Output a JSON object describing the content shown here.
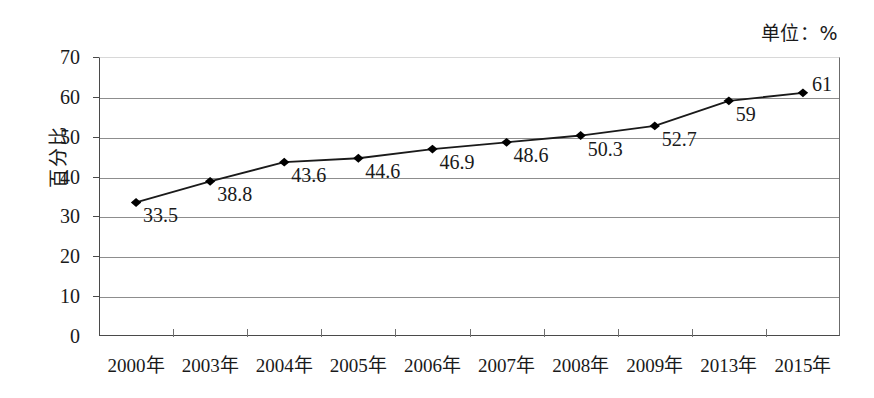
{
  "unit_note": "单位：%",
  "chart_data": {
    "type": "line",
    "title": "",
    "subtitle": "",
    "xlabel": "",
    "ylabel": "百分比",
    "unit_note": "单位：%",
    "categories": [
      "2000年",
      "2003年",
      "2004年",
      "2005年",
      "2006年",
      "2007年",
      "2008年",
      "2009年",
      "2013年",
      "2015年"
    ],
    "values": [
      33.5,
      38.8,
      43.6,
      44.6,
      46.9,
      48.6,
      50.3,
      52.7,
      59,
      61
    ],
    "point_labels": [
      "33.5",
      "38.8",
      "43.6",
      "44.6",
      "46.9",
      "48.6",
      "50.3",
      "52.7",
      "59",
      "61"
    ],
    "ylim": [
      0,
      70
    ],
    "ytick_step": 10,
    "yticks": [
      0,
      10,
      20,
      30,
      40,
      50,
      60,
      70
    ],
    "ytick_labels": [
      "0",
      "10",
      "20",
      "30",
      "40",
      "50",
      "60",
      "70"
    ],
    "grid": true,
    "grid_axis": "y",
    "legend": false,
    "legend_position": "none",
    "marker": "diamond",
    "line_color": "#1a1a1a",
    "marker_color": "#000000",
    "grid_color": "#8d8d8d",
    "axis_color": "#4a4a4a",
    "text_color": "#1a1a1a",
    "background": "#ffffff"
  }
}
